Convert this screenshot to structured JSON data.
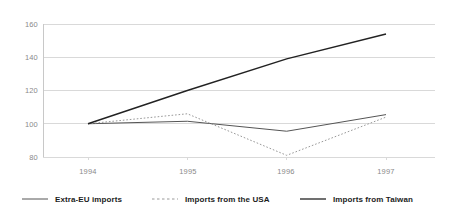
{
  "chart_data": {
    "type": "line",
    "title": "",
    "subtitle": "",
    "xlabel": "",
    "ylabel": "",
    "categories": [
      "1994",
      "1995",
      "1996",
      "1997"
    ],
    "x_tick_labels": [
      "1994",
      "1995",
      "1996",
      "1997"
    ],
    "y_tick_labels": [
      "80",
      "100",
      "120",
      "140",
      "160"
    ],
    "y_ticks": [
      80,
      100,
      120,
      140,
      160
    ],
    "ylim": [
      80,
      160
    ],
    "grid": "horizontal",
    "legend_position": "bottom",
    "series": [
      {
        "name": "Extra-EU imports",
        "values": [
          100,
          101.5,
          95.5,
          105.5
        ],
        "style": "solid",
        "color": "#555555",
        "width": 1
      },
      {
        "name": "Imports from the USA",
        "values": [
          100,
          106,
          81,
          104
        ],
        "style": "dotted",
        "color": "#999999",
        "width": 1
      },
      {
        "name": "Imports from Taiwan",
        "values": [
          100,
          120,
          139,
          154
        ],
        "style": "solid",
        "color": "#222222",
        "width": 1.4
      }
    ]
  },
  "axis": {
    "y_axis_color": "#c8c8c8",
    "grid_color": "#d9d9d9",
    "tick_text_color": "#8a8a8a"
  },
  "legend": {
    "entries": [
      {
        "label": "Extra-EU imports",
        "style": "solid",
        "color": "#555555"
      },
      {
        "label": "Imports from the USA",
        "style": "dotted",
        "color": "#999999"
      },
      {
        "label": "Imports from Taiwan",
        "style": "solid",
        "color": "#222222"
      }
    ]
  }
}
